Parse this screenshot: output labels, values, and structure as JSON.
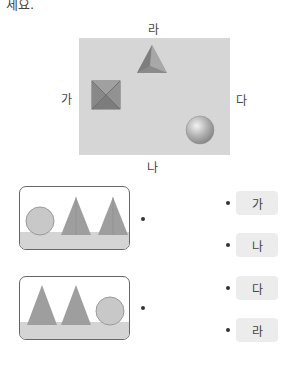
{
  "instruction_tail": "세요.",
  "scene": {
    "labels": {
      "top": "라",
      "left": "가",
      "right": "다",
      "bottom": "나"
    },
    "objects": [
      "square-pyramid-top-view",
      "triangular-pyramid",
      "sphere"
    ]
  },
  "cards": [
    {
      "description": "circle, triangle, triangle (left to right)"
    },
    {
      "description": "triangle, triangle, circle (left to right)"
    }
  ],
  "options": [
    {
      "label": "가"
    },
    {
      "label": "나"
    },
    {
      "label": "다"
    },
    {
      "label": "라"
    }
  ],
  "colors": {
    "scene_bg": "#d6d6d6",
    "option_bg": "#ececec",
    "shape_gray": "#9a9a9a"
  }
}
